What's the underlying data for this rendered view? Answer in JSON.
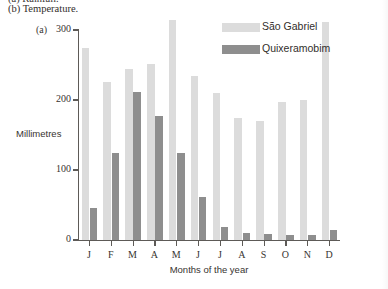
{
  "caption": {
    "cut_line": "(a) Rainfall.",
    "line_b": "(b) Temperature."
  },
  "panel": {
    "label": "(a)"
  },
  "legend": {
    "items": [
      {
        "label": "São Gabriel",
        "color": "#dcdcdc",
        "swatch_name": "legend-swatch-sao-gabriel"
      },
      {
        "label": "Quixeramobim",
        "color": "#8e8e8e",
        "swatch_name": "legend-swatch-quixeramobim"
      }
    ]
  },
  "chart_data": {
    "type": "bar",
    "title": "",
    "xlabel": "Months of the year",
    "ylabel": "Millimetres",
    "ylim": [
      0,
      300
    ],
    "yticks": [
      0,
      100,
      200,
      300
    ],
    "ytick_labels": [
      "0",
      "100",
      "200",
      "300"
    ],
    "grid": false,
    "legend_position": "top-right",
    "categories": [
      "J",
      "F",
      "M",
      "A",
      "M",
      "J",
      "J",
      "A",
      "S",
      "O",
      "N",
      "D"
    ],
    "category_full": [
      "January",
      "February",
      "March",
      "April",
      "May",
      "June",
      "July",
      "August",
      "September",
      "October",
      "November",
      "December"
    ],
    "series": [
      {
        "name": "São Gabriel",
        "color": "#dcdcdc",
        "values": [
          275,
          226,
          245,
          251,
          315,
          234,
          210,
          175,
          170,
          197,
          200,
          312
        ]
      },
      {
        "name": "Quixeramobim",
        "color": "#8e8e8e",
        "values": [
          46,
          125,
          211,
          177,
          124,
          61,
          19,
          10,
          8,
          7,
          7,
          14
        ]
      }
    ]
  }
}
